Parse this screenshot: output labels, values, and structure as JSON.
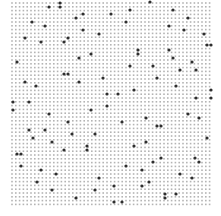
{
  "canvas": {
    "width": 221,
    "height": 216,
    "background": "#ffffff"
  },
  "grid": {
    "x_start": 12,
    "y_start": 3,
    "cols": 53,
    "rows": 54,
    "pitch_x": 3.8,
    "pitch_y": 3.8,
    "dot_size": 1.6,
    "dot_color": "#b4b4b4"
  },
  "highlights": {
    "dot_size": 3.2,
    "dot_color": "#2e2e2e",
    "points": [
      [
        60,
        3
      ],
      [
        49,
        7
      ],
      [
        60,
        7
      ],
      [
        150,
        2
      ],
      [
        130,
        10
      ],
      [
        173,
        10
      ],
      [
        83,
        14
      ],
      [
        76,
        18
      ],
      [
        111,
        14
      ],
      [
        32,
        22
      ],
      [
        45,
        26
      ],
      [
        126,
        22
      ],
      [
        188,
        18
      ],
      [
        169,
        26
      ],
      [
        83,
        30
      ],
      [
        99,
        34
      ],
      [
        184,
        30
      ],
      [
        204,
        34
      ],
      [
        25,
        38
      ],
      [
        68,
        38
      ],
      [
        41,
        42
      ],
      [
        64,
        42
      ],
      [
        207,
        45
      ],
      [
        211,
        45
      ],
      [
        138,
        50
      ],
      [
        169,
        50
      ],
      [
        91,
        54
      ],
      [
        138,
        54
      ],
      [
        79,
        58
      ],
      [
        173,
        58
      ],
      [
        17,
        62
      ],
      [
        192,
        62
      ],
      [
        130,
        66
      ],
      [
        153,
        66
      ],
      [
        180,
        70
      ],
      [
        196,
        70
      ],
      [
        64,
        74
      ],
      [
        68,
        74
      ],
      [
        103,
        78
      ],
      [
        157,
        78
      ],
      [
        25,
        82
      ],
      [
        79,
        82
      ],
      [
        36,
        86
      ],
      [
        176,
        86
      ],
      [
        134,
        90
      ],
      [
        211,
        90
      ],
      [
        107,
        94
      ],
      [
        118,
        94
      ],
      [
        196,
        98
      ],
      [
        211,
        98
      ],
      [
        13,
        102
      ],
      [
        29,
        102
      ],
      [
        107,
        106
      ],
      [
        13,
        110
      ],
      [
        91,
        110
      ],
      [
        49,
        114
      ],
      [
        188,
        114
      ],
      [
        146,
        118
      ],
      [
        199,
        118
      ],
      [
        68,
        122
      ],
      [
        122,
        122
      ],
      [
        157,
        126
      ],
      [
        161,
        126
      ],
      [
        29,
        130
      ],
      [
        45,
        130
      ],
      [
        72,
        134
      ],
      [
        95,
        134
      ],
      [
        33,
        138
      ],
      [
        207,
        138
      ],
      [
        52,
        142
      ],
      [
        146,
        142
      ],
      [
        134,
        146
      ],
      [
        87,
        146
      ],
      [
        64,
        150
      ],
      [
        87,
        150
      ],
      [
        17,
        154
      ],
      [
        21,
        154
      ],
      [
        161,
        158
      ],
      [
        195,
        158
      ],
      [
        153,
        162
      ],
      [
        199,
        162
      ],
      [
        21,
        166
      ],
      [
        126,
        166
      ],
      [
        41,
        170
      ],
      [
        142,
        170
      ],
      [
        56,
        174
      ],
      [
        180,
        174
      ],
      [
        99,
        178
      ],
      [
        192,
        178
      ],
      [
        37,
        182
      ],
      [
        149,
        182
      ],
      [
        114,
        186
      ],
      [
        142,
        186
      ],
      [
        52,
        190
      ],
      [
        95,
        190
      ],
      [
        165,
        194
      ],
      [
        176,
        194
      ],
      [
        76,
        198
      ],
      [
        165,
        198
      ],
      [
        114,
        202
      ],
      [
        122,
        202
      ]
    ]
  }
}
